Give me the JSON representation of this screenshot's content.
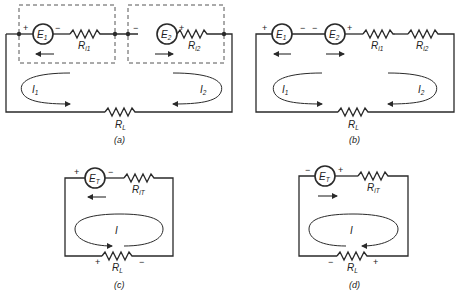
{
  "figure": {
    "panels": [
      {
        "id": "a",
        "caption": "(a)",
        "sources": [
          {
            "name": "E",
            "sub": "1",
            "left_sign": "+",
            "right_sign": "−",
            "arrow": "left"
          },
          {
            "name": "E",
            "sub": "2",
            "left_sign": "−",
            "right_sign": "+",
            "arrow": "right"
          }
        ],
        "resistors": [
          {
            "name": "R",
            "sub": "i1"
          },
          {
            "name": "R",
            "sub": "i2"
          },
          {
            "name": "R",
            "sub": "L"
          }
        ],
        "currents": [
          {
            "name": "I",
            "sub": "1",
            "direction": "clockwise"
          },
          {
            "name": "I",
            "sub": "2",
            "direction": "counterclockwise"
          }
        ],
        "note": "Two sources with internal resistances in dashed boxes, connected series-opposing"
      },
      {
        "id": "b",
        "caption": "(b)",
        "sources": [
          {
            "name": "E",
            "sub": "1",
            "left_sign": "+",
            "right_sign": "−",
            "arrow": "left"
          },
          {
            "name": "E",
            "sub": "2",
            "left_sign": "−",
            "right_sign": "+",
            "arrow": "right"
          }
        ],
        "resistors": [
          {
            "name": "R",
            "sub": "i1"
          },
          {
            "name": "R",
            "sub": "i2"
          },
          {
            "name": "R",
            "sub": "L"
          }
        ],
        "currents": [
          {
            "name": "I",
            "sub": "1",
            "direction": "clockwise"
          },
          {
            "name": "I",
            "sub": "2",
            "direction": "counterclockwise"
          }
        ]
      },
      {
        "id": "c",
        "caption": "(c)",
        "sources": [
          {
            "name": "E",
            "sub": "T",
            "left_sign": "+",
            "right_sign": "−",
            "arrow": "left"
          }
        ],
        "resistors": [
          {
            "name": "R",
            "sub": "iT"
          },
          {
            "name": "R",
            "sub": "L",
            "left_sign": "+",
            "right_sign": "−"
          }
        ],
        "currents": [
          {
            "name": "I",
            "sub": "",
            "direction": "clockwise"
          }
        ]
      },
      {
        "id": "d",
        "caption": "(d)",
        "sources": [
          {
            "name": "E",
            "sub": "T",
            "left_sign": "−",
            "right_sign": "+",
            "arrow": "right"
          }
        ],
        "resistors": [
          {
            "name": "R",
            "sub": "iT"
          },
          {
            "name": "R",
            "sub": "L",
            "left_sign": "−",
            "right_sign": "+"
          }
        ],
        "currents": [
          {
            "name": "I",
            "sub": "",
            "direction": "counterclockwise"
          }
        ]
      }
    ],
    "labels": {
      "E": "E",
      "R": "R",
      "I": "I",
      "plus": "+",
      "minus": "−",
      "sub_1": "1",
      "sub_2": "2",
      "sub_T": "T",
      "sub_i1": "i1",
      "sub_i2": "i2",
      "sub_iT": "iT",
      "sub_L": "L",
      "cap_a": "(a)",
      "cap_b": "(b)",
      "cap_c": "(c)",
      "cap_d": "(d)"
    }
  }
}
